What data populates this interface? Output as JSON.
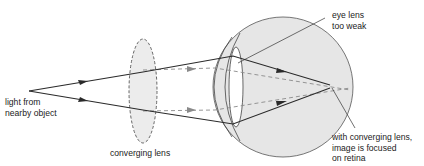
{
  "diagram": {
    "labels": {
      "object": [
        "light from",
        "nearby object"
      ],
      "converging_lens": "converging lens",
      "eye_lens": [
        "eye lens",
        "too weak"
      ],
      "focus": [
        "with converging lens,",
        "image is focused",
        "on retina"
      ]
    },
    "colors": {
      "line": "#2a2a2a",
      "dashed_ray": "#8a8a8a",
      "eye_fill": "#e6e6e6",
      "lens_fill": "#ececec",
      "background": "#ffffff"
    }
  }
}
